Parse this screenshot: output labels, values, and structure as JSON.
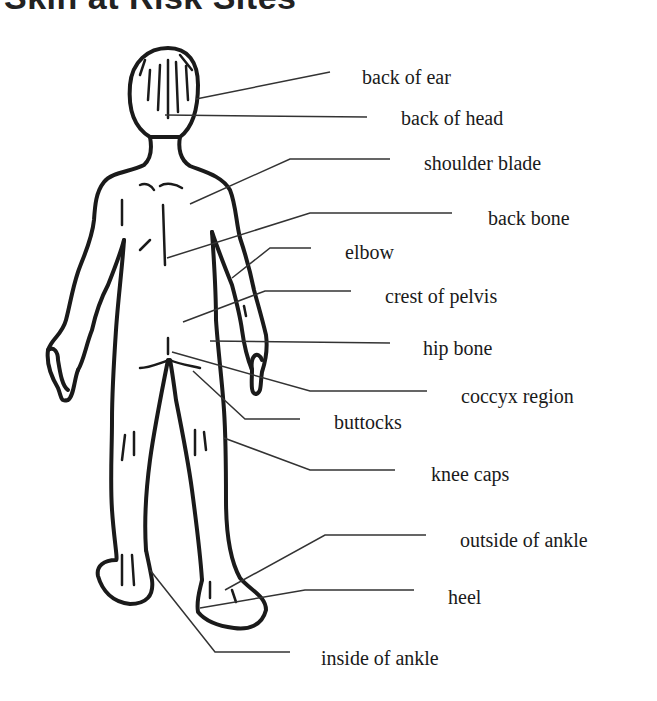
{
  "title": "Skin at Risk Sites",
  "colors": {
    "ink": "#1a1a1a",
    "leader": "#333333",
    "background": "#ffffff"
  },
  "labels": [
    {
      "id": "back-of-ear",
      "text": "back of ear",
      "x": 362,
      "y": 67
    },
    {
      "id": "back-of-head",
      "text": "back of head",
      "x": 401,
      "y": 108
    },
    {
      "id": "shoulder-blade",
      "text": "shoulder blade",
      "x": 424,
      "y": 153
    },
    {
      "id": "back-bone",
      "text": "back bone",
      "x": 488,
      "y": 208
    },
    {
      "id": "elbow",
      "text": "elbow",
      "x": 345,
      "y": 242
    },
    {
      "id": "crest-of-pelvis",
      "text": "crest of pelvis",
      "x": 385,
      "y": 286
    },
    {
      "id": "hip-bone",
      "text": "hip bone",
      "x": 423,
      "y": 338
    },
    {
      "id": "coccyx-region",
      "text": "coccyx region",
      "x": 461,
      "y": 386
    },
    {
      "id": "buttocks",
      "text": "buttocks",
      "x": 334,
      "y": 412
    },
    {
      "id": "knee-caps",
      "text": "knee caps",
      "x": 431,
      "y": 464
    },
    {
      "id": "outside-of-ankle",
      "text": "outside of ankle",
      "x": 460,
      "y": 530
    },
    {
      "id": "heel",
      "text": "heel",
      "x": 448,
      "y": 587
    },
    {
      "id": "inside-of-ankle",
      "text": "inside of ankle",
      "x": 321,
      "y": 648
    }
  ]
}
